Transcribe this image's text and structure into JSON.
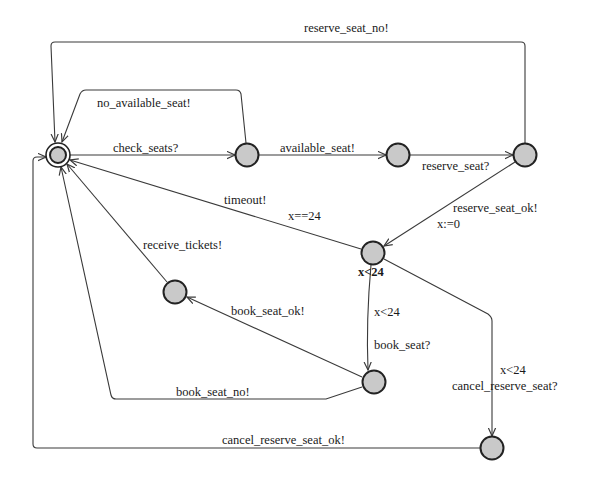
{
  "diagram": {
    "type": "timed-automaton",
    "colors": {
      "node_fill": "#c9c9c9",
      "node_stroke": "#222222",
      "edge": "#3a3a3a",
      "text": "#1a1a1a",
      "background": "#ffffff"
    },
    "nodes": [
      {
        "id": "initial",
        "x": 58,
        "y": 155,
        "initial": true,
        "invariant": ""
      },
      {
        "id": "s_checked",
        "x": 247,
        "y": 155,
        "initial": false,
        "invariant": ""
      },
      {
        "id": "s_available",
        "x": 398,
        "y": 155,
        "initial": false,
        "invariant": ""
      },
      {
        "id": "s_reserve_req",
        "x": 525,
        "y": 155,
        "initial": false,
        "invariant": ""
      },
      {
        "id": "s_reserved",
        "x": 373,
        "y": 253,
        "initial": false,
        "invariant": "x<24"
      },
      {
        "id": "s_booked",
        "x": 175,
        "y": 292,
        "initial": false,
        "invariant": ""
      },
      {
        "id": "s_booking",
        "x": 374,
        "y": 382,
        "initial": false,
        "invariant": ""
      },
      {
        "id": "s_cancelling",
        "x": 492,
        "y": 448,
        "initial": false,
        "invariant": ""
      }
    ],
    "invariants": {
      "s_reserved": "x<24"
    },
    "edges": [
      {
        "from": "initial",
        "to": "s_checked",
        "sync": "check_seats?",
        "guard": "",
        "update": ""
      },
      {
        "from": "s_checked",
        "to": "initial",
        "sync": "no_available_seat!",
        "guard": "",
        "update": ""
      },
      {
        "from": "s_checked",
        "to": "s_available",
        "sync": "available_seat!",
        "guard": "",
        "update": ""
      },
      {
        "from": "s_available",
        "to": "s_reserve_req",
        "sync": "reserve_seat?",
        "guard": "",
        "update": ""
      },
      {
        "from": "s_reserve_req",
        "to": "initial",
        "sync": "reserve_seat_no!",
        "guard": "",
        "update": ""
      },
      {
        "from": "s_reserve_req",
        "to": "s_reserved",
        "sync": "reserve_seat_ok!",
        "guard": "",
        "update": "x:=0"
      },
      {
        "from": "s_reserved",
        "to": "initial",
        "sync": "timeout!",
        "guard": "x==24",
        "update": ""
      },
      {
        "from": "s_reserved",
        "to": "s_booking",
        "sync": "book_seat?",
        "guard": "x<24",
        "update": ""
      },
      {
        "from": "s_reserved",
        "to": "s_cancelling",
        "sync": "cancel_reserve_seat?",
        "guard": "x<24",
        "update": ""
      },
      {
        "from": "s_booking",
        "to": "s_booked",
        "sync": "book_seat_ok!",
        "guard": "",
        "update": ""
      },
      {
        "from": "s_booking",
        "to": "initial",
        "sync": "book_seat_no!",
        "guard": "",
        "update": ""
      },
      {
        "from": "s_booked",
        "to": "initial",
        "sync": "receive_tickets!",
        "guard": "",
        "update": ""
      },
      {
        "from": "s_cancelling",
        "to": "initial",
        "sync": "cancel_reserve_seat_ok!",
        "guard": "",
        "update": ""
      }
    ]
  },
  "labels": {
    "reserve_seat_no": "reserve_seat_no!",
    "no_available_seat": "no_available_seat!",
    "check_seats": "check_seats?",
    "available_seat": "available_seat!",
    "reserve_seat": "reserve_seat?",
    "timeout": "timeout!",
    "timeout_guard": "x==24",
    "reserve_seat_ok": "reserve_seat_ok!",
    "reserve_seat_ok_update": "x:=0",
    "invariant_reserved": "x<24",
    "receive_tickets": "receive_tickets!",
    "book_seat_guard": "x<24",
    "book_seat_ok": "book_seat_ok!",
    "book_seat": "book_seat?",
    "cancel_guard": "x<24",
    "cancel_reserve_seat": "cancel_reserve_seat?",
    "book_seat_no": "book_seat_no!",
    "cancel_reserve_seat_ok": "cancel_reserve_seat_ok!"
  }
}
